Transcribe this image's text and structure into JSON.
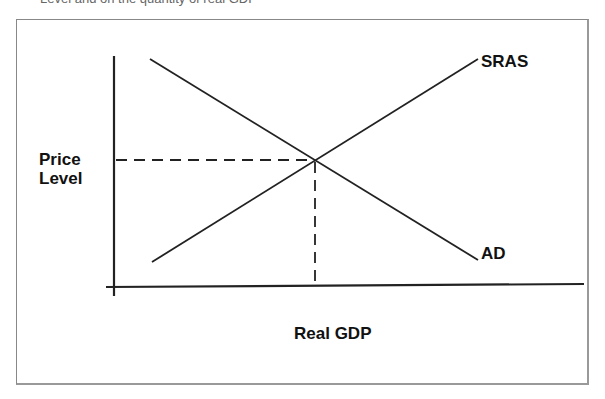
{
  "caption_partial": "Level and on the quantity of real GDP",
  "diagram": {
    "type": "AD-AS model",
    "y_axis_label_line1": "Price",
    "y_axis_label_line2": "Level",
    "x_axis_label": "Real GDP",
    "curves": [
      {
        "name": "SRAS",
        "label": "SRAS",
        "from": [
          152,
          262
        ],
        "to": [
          478,
          59
        ],
        "slope": "upward"
      },
      {
        "name": "AD",
        "label": "AD",
        "from": [
          150,
          59
        ],
        "to": [
          478,
          260
        ],
        "slope": "downward"
      }
    ],
    "equilibrium": {
      "x": 315,
      "y": 160,
      "dashed_guides": true
    }
  }
}
